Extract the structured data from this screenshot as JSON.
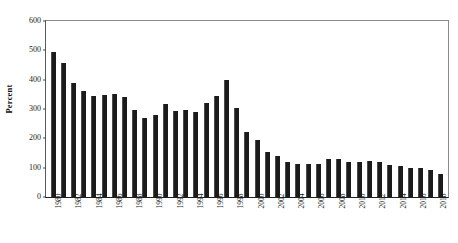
{
  "chart_data": {
    "type": "bar",
    "title": "",
    "xlabel": "",
    "ylabel": "Percent",
    "ylim": [
      0,
      600
    ],
    "yticks": [
      0,
      100,
      200,
      300,
      400,
      500,
      600
    ],
    "ytick_labels": [
      "0",
      "100",
      "200",
      "300",
      "400",
      "500",
      "600"
    ],
    "grid": false,
    "legend": "none",
    "bar_color": "#1b1b1b",
    "categories": [
      "1980",
      "1981",
      "1982",
      "1983",
      "1984",
      "1985",
      "1986",
      "1987",
      "1988",
      "1989",
      "1990",
      "1991",
      "1992",
      "1993",
      "1994",
      "1995",
      "1996",
      "1997",
      "1998",
      "1999",
      "2000",
      "2001",
      "2002",
      "2003",
      "2004",
      "2005",
      "2006",
      "2007",
      "2008",
      "2009",
      "2010",
      "2011",
      "2012",
      "2013",
      "2014",
      "2015",
      "2016",
      "2017",
      "2018"
    ],
    "xtick_labels_shown": [
      "1980",
      "1982",
      "1984",
      "1986",
      "1988",
      "1990",
      "1992",
      "1994",
      "1996",
      "1998",
      "2000",
      "2002",
      "2004",
      "2006",
      "2008",
      "2010",
      "2012",
      "2014",
      "2016",
      "2018"
    ],
    "values": [
      495,
      458,
      387,
      360,
      343,
      348,
      352,
      342,
      297,
      268,
      280,
      318,
      293,
      296,
      290,
      320,
      345,
      400,
      305,
      222,
      195,
      155,
      140,
      120,
      112,
      113,
      113,
      128,
      130,
      120,
      120,
      122,
      118,
      110,
      105,
      100,
      100,
      92,
      80
    ]
  }
}
